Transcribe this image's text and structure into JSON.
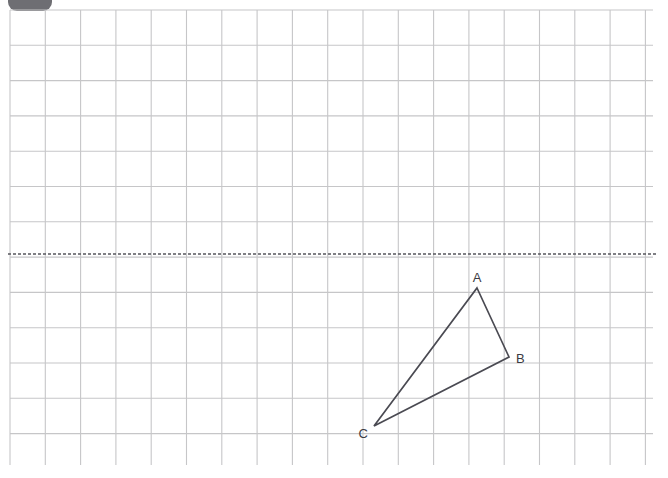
{
  "canvas": {
    "width": 668,
    "height": 478,
    "background_color": "#ffffff"
  },
  "corner_tab": {
    "name": "partial-rounded-tab",
    "color": "#6e6e73",
    "x": 8,
    "y": -16,
    "width": 44,
    "height": 27
  },
  "grid": {
    "label": "square grid",
    "line_color": "#c6c6c8",
    "line_width": 1.1,
    "cell_size": 35.3,
    "left": 10,
    "top": 10,
    "right": 653,
    "bottom": 465,
    "columns": 18,
    "rows": 13
  },
  "mirror_line": {
    "label": "line of reflection",
    "style": "dashed",
    "color": "#55555c",
    "width": 1.6,
    "dash": "3 2",
    "y": 254,
    "x_start": 8,
    "x_end": 656
  },
  "figure": {
    "name": "triangle ABC",
    "stroke_color": "#4a4a52",
    "stroke_width": 1.7,
    "fill": "none",
    "vertices": [
      {
        "id": "A",
        "label": "A",
        "x": 477,
        "y": 288,
        "label_x": 477,
        "label_y": 282,
        "label_anchor": "middle"
      },
      {
        "id": "B",
        "label": "B",
        "x": 509,
        "y": 357,
        "label_x": 516,
        "label_y": 363,
        "label_anchor": "start"
      },
      {
        "id": "C",
        "label": "C",
        "x": 374,
        "y": 426,
        "label_x": 368,
        "label_y": 438,
        "label_anchor": "end"
      }
    ],
    "edges": [
      {
        "from": "A",
        "to": "B"
      },
      {
        "from": "B",
        "to": "C"
      },
      {
        "from": "C",
        "to": "A"
      }
    ],
    "path": "M 477 288 L 509 357 L 374 426 Z"
  }
}
